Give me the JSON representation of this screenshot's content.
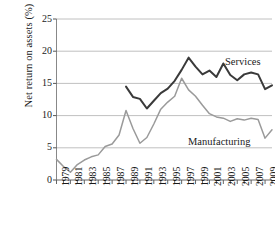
{
  "chart_data": {
    "type": "line",
    "title": "",
    "xlabel": "",
    "ylabel": "Net return on assets (%)",
    "ylim": [
      0,
      25
    ],
    "xlim": [
      1979,
      2010
    ],
    "ytick_values": [
      0,
      5,
      10,
      15,
      20,
      25
    ],
    "ytick_labels": [
      "0",
      "5",
      "10",
      "15",
      "20",
      "25"
    ],
    "xtick_labels": [
      "1979",
      "1981",
      "1983",
      "1985",
      "1987",
      "1989",
      "1991",
      "1993",
      "1995",
      "1997",
      "1999",
      "2001",
      "2003",
      "2005",
      "2007",
      "2009"
    ],
    "xtick_values": [
      1979,
      1981,
      1983,
      1985,
      1987,
      1989,
      1991,
      1993,
      1995,
      1997,
      1999,
      2001,
      2003,
      2005,
      2007,
      2009
    ],
    "x": [
      1979,
      1980,
      1981,
      1982,
      1983,
      1984,
      1985,
      1986,
      1987,
      1988,
      1989,
      1990,
      1991,
      1992,
      1993,
      1994,
      1995,
      1996,
      1997,
      1998,
      1999,
      2000,
      2001,
      2002,
      2003,
      2004,
      2005,
      2006,
      2007,
      2008,
      2009,
      2010
    ],
    "grid": true,
    "legend_position": "inline-annotations",
    "series": [
      {
        "name": "Services",
        "color": "#3a3a3a",
        "annotation": "Services",
        "x": [
          1989,
          1990,
          1991,
          1992,
          1993,
          1994,
          1995,
          1996,
          1997,
          1998,
          1999,
          2000,
          2001,
          2002,
          2003,
          2004,
          2005,
          2006,
          2007,
          2008,
          2009,
          2010
        ],
        "values": [
          14.5,
          12.9,
          12.6,
          11.1,
          12.3,
          13.5,
          14.2,
          15.4,
          17.1,
          19.0,
          17.6,
          16.4,
          17.0,
          16.0,
          18.1,
          16.3,
          15.5,
          16.4,
          16.7,
          16.4,
          14.1,
          14.7
        ]
      },
      {
        "name": "Manufacturing",
        "color": "#9a9a9a",
        "annotation": "Manufacturing",
        "x": [
          1979,
          1980,
          1981,
          1982,
          1983,
          1984,
          1985,
          1986,
          1987,
          1988,
          1989,
          1990,
          1991,
          1992,
          1993,
          1994,
          1995,
          1996,
          1997,
          1998,
          1999,
          2000,
          2001,
          2002,
          2003,
          2004,
          2005,
          2006,
          2007,
          2008,
          2009,
          2010
        ],
        "values": [
          3.2,
          2.1,
          1.2,
          2.4,
          3.1,
          3.6,
          3.9,
          5.2,
          5.6,
          7.0,
          10.8,
          8.0,
          5.7,
          6.6,
          8.7,
          11.0,
          12.1,
          13.0,
          15.8,
          14.0,
          13.0,
          11.6,
          10.3,
          9.8,
          9.6,
          9.1,
          9.5,
          9.3,
          9.6,
          9.4,
          6.5,
          7.8
        ]
      }
    ]
  }
}
